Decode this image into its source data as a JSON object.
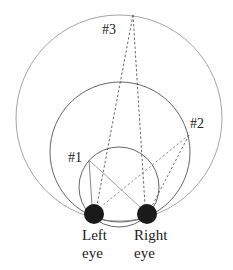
{
  "diagram": {
    "points": [
      {
        "id": "p1",
        "label": "#1"
      },
      {
        "id": "p2",
        "label": "#2"
      },
      {
        "id": "p3",
        "label": "#3"
      }
    ],
    "eyes": {
      "left": {
        "line1": "Left",
        "line2": "eye"
      },
      "right": {
        "line1": "Right",
        "line2": "eye"
      }
    },
    "colors": {
      "eye": "#1a1a1a",
      "circle_small": "#555555",
      "circle_medium": "#555555",
      "circle_large": "#9a9a9a",
      "solid_lines": "#888888",
      "dashed_lines": "#444444"
    }
  }
}
